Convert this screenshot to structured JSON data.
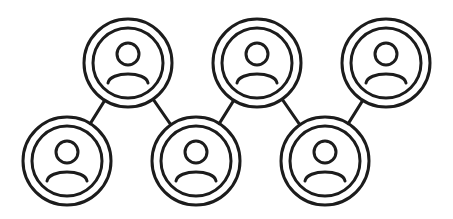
{
  "diagram": {
    "title": "User network",
    "stroke_color": "#1c1c1c",
    "background": "#ffffff",
    "node_outer_radius": 44,
    "node_inner_radius": 35,
    "nodes": [
      {
        "id": "n1",
        "label": "User 1",
        "icon": "user-icon",
        "cx": 67,
        "cy": 161
      },
      {
        "id": "n2",
        "label": "User 2",
        "icon": "user-icon",
        "cx": 128,
        "cy": 63
      },
      {
        "id": "n3",
        "label": "User 3",
        "icon": "user-icon",
        "cx": 196,
        "cy": 161
      },
      {
        "id": "n4",
        "label": "User 4",
        "icon": "user-icon",
        "cx": 257,
        "cy": 63
      },
      {
        "id": "n5",
        "label": "User 5",
        "icon": "user-icon",
        "cx": 325,
        "cy": 161
      },
      {
        "id": "n6",
        "label": "User 6",
        "icon": "user-icon",
        "cx": 386,
        "cy": 63
      }
    ],
    "edges": [
      {
        "from": "n2",
        "to": "n1"
      },
      {
        "from": "n2",
        "to": "n3"
      },
      {
        "from": "n3",
        "to": "n4"
      },
      {
        "from": "n4",
        "to": "n5"
      },
      {
        "from": "n5",
        "to": "n6"
      }
    ]
  }
}
